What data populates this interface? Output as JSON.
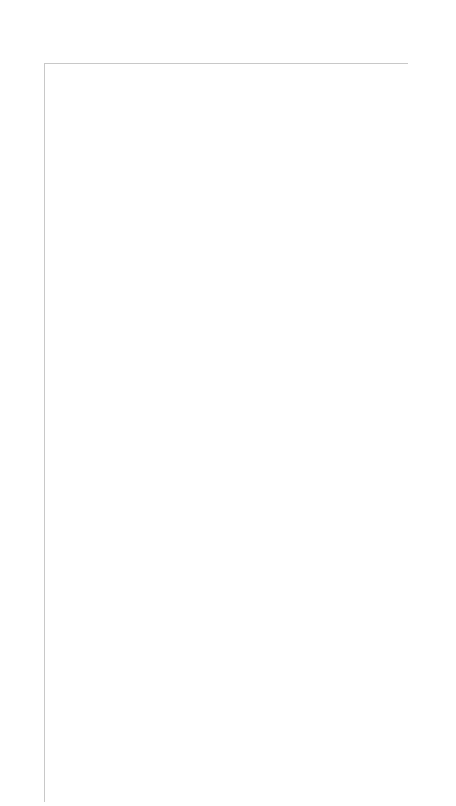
{
  "key_label": "Key",
  "grid": {
    "columns": 15,
    "rows": 30,
    "line_color": "#c8c8c8",
    "symbol_color": "#000000"
  },
  "symbols": {
    "dot": "purl (filled dot)",
    "B": "B",
    "O": "yarn over (circle)",
    "bs": "backslash decrease",
    "fs": "forward-slash decrease",
    "": "knit (blank)"
  },
  "left_row_labels": [
    30,
    28,
    26,
    24,
    22,
    20,
    18,
    16,
    14,
    12,
    10,
    8,
    6,
    4,
    2
  ],
  "right_row_labels": [
    29,
    27,
    25,
    23,
    21,
    19,
    17,
    15,
    13,
    11,
    9,
    7,
    5,
    3,
    1
  ],
  "chart_data": {
    "type": "table",
    "rows": [
      {
        "row": 30,
        "cells": [
          "dot",
          "dot",
          "dot",
          "dot",
          "dot",
          "dot",
          "dot",
          "dot",
          "dot",
          "dot",
          "dot",
          "dot",
          "dot",
          "dot",
          "dot"
        ]
      },
      {
        "row": 29,
        "cells": [
          "dot",
          "dot",
          "dot",
          "dot",
          "dot",
          "dot",
          "B",
          "",
          "B",
          "dot",
          "dot",
          "dot",
          "dot",
          "dot",
          "dot"
        ]
      },
      {
        "row": 28,
        "cells": [
          "dot",
          "dot",
          "dot",
          "dot",
          "dot",
          "dot",
          "",
          "dot",
          "",
          "dot",
          "dot",
          "dot",
          "dot",
          "dot",
          "dot"
        ]
      },
      {
        "row": 27,
        "cells": [
          "dot",
          "dot",
          "dot",
          "dot",
          "B",
          "",
          "dot",
          "",
          "dot",
          "",
          "B",
          "dot",
          "dot",
          "dot",
          "dot"
        ]
      },
      {
        "row": 26,
        "cells": [
          "dot",
          "dot",
          "dot",
          "dot",
          "",
          "dot",
          "",
          "dot",
          "",
          "dot",
          "",
          "dot",
          "dot",
          "dot",
          "dot"
        ]
      },
      {
        "row": 25,
        "cells": [
          "dot",
          "dot",
          "dot",
          "B",
          "dot",
          "",
          "dot",
          "",
          "dot",
          "",
          "dot",
          "B",
          "dot",
          "dot",
          "dot"
        ]
      },
      {
        "row": 24,
        "cells": [
          "dot",
          "dot",
          "dot",
          "dot",
          "",
          "dot",
          "",
          "dot",
          "",
          "dot",
          "",
          "dot",
          "dot",
          "dot",
          "dot"
        ]
      },
      {
        "row": 23,
        "cells": [
          "dot",
          "dot",
          "dot",
          "B",
          "dot",
          "",
          "dot",
          "",
          "dot",
          "",
          "dot",
          "B",
          "dot",
          "dot",
          "dot"
        ]
      },
      {
        "row": 22,
        "cells": [
          "",
          "dot",
          "dot",
          "dot",
          "",
          "dot",
          "",
          "dot",
          "",
          "dot",
          "",
          "dot",
          "dot",
          "dot",
          ""
        ]
      },
      {
        "row": 21,
        "cells": [
          "bs",
          "",
          "O",
          "dot",
          "B",
          "",
          "dot",
          "",
          "dot",
          "",
          "B",
          "dot",
          "O",
          "",
          "fs"
        ]
      },
      {
        "row": 20,
        "cells": [
          "",
          "",
          "",
          "dot",
          "dot",
          "dot",
          "",
          "dot",
          "",
          "dot",
          "dot",
          "dot",
          "",
          "",
          ""
        ]
      },
      {
        "row": 19,
        "cells": [
          "",
          "bs",
          "",
          "O",
          "dot",
          "dot",
          "B",
          "",
          "B",
          "dot",
          "dot",
          "O",
          "",
          "fs",
          ""
        ]
      },
      {
        "row": 18,
        "cells": [
          "",
          "",
          "",
          "",
          "dot",
          "dot",
          "dot",
          "",
          "dot",
          "dot",
          "dot",
          "",
          "",
          "",
          ""
        ]
      },
      {
        "row": 17,
        "cells": [
          "",
          "",
          "bs",
          "",
          "O",
          "dot",
          "dot",
          "",
          "dot",
          "dot",
          "O",
          "",
          "fs",
          "",
          ""
        ]
      },
      {
        "row": 16,
        "cells": [
          "",
          "",
          "",
          "",
          "",
          "dot",
          "dot",
          "",
          "dot",
          "dot",
          "",
          "",
          "",
          "",
          ""
        ]
      },
      {
        "row": 15,
        "cells": [
          "",
          "",
          "",
          "bs",
          "",
          "O",
          "dot",
          "",
          "dot",
          "O",
          "",
          "fs",
          "",
          "",
          ""
        ]
      },
      {
        "row": 14,
        "cells": [
          "",
          "",
          "",
          "",
          "",
          "",
          "dot",
          "",
          "dot",
          "",
          "",
          "",
          "",
          "",
          ""
        ]
      },
      {
        "row": 13,
        "cells": [
          "",
          "",
          "",
          "",
          "bs",
          "",
          "O",
          "",
          "O",
          "",
          "fs",
          "",
          "",
          "",
          ""
        ]
      },
      {
        "row": 12,
        "cells": [
          "",
          "",
          "",
          "",
          "",
          "",
          "",
          "dot",
          "",
          "",
          "",
          "",
          "",
          "",
          ""
        ]
      },
      {
        "row": 11,
        "cells": [
          "bs",
          "",
          "O",
          "",
          "",
          "",
          "",
          "dot",
          "",
          "",
          "",
          "",
          "O",
          "",
          "fs"
        ]
      },
      {
        "row": 10,
        "cells": [
          "dot",
          "",
          "",
          "",
          "",
          "",
          "",
          "dot",
          "",
          "",
          "",
          "",
          "",
          "",
          "dot"
        ]
      },
      {
        "row": 9,
        "cells": [
          "dot",
          "bs",
          "",
          "O",
          "",
          "",
          "",
          "dot",
          "",
          "",
          "",
          "O",
          "",
          "fs",
          "dot"
        ]
      },
      {
        "row": 8,
        "cells": [
          "dot",
          "dot",
          "",
          "",
          "",
          "",
          "",
          "dot",
          "",
          "",
          "",
          "",
          "",
          "dot",
          "dot"
        ]
      },
      {
        "row": 7,
        "cells": [
          "dot",
          "dot",
          "bs",
          "",
          "O",
          "",
          "",
          "dot",
          "",
          "",
          "O",
          "",
          "fs",
          "dot",
          "dot"
        ]
      },
      {
        "row": 6,
        "cells": [
          "dot",
          "dot",
          "dot",
          "",
          "",
          "",
          "",
          "dot",
          "",
          "",
          "",
          "",
          "dot",
          "dot",
          "dot"
        ]
      },
      {
        "row": 5,
        "cells": [
          "dot",
          "dot",
          "dot",
          "bs",
          "",
          "O",
          "",
          "dot",
          "",
          "O",
          "",
          "fs",
          "dot",
          "dot",
          "dot"
        ]
      },
      {
        "row": 4,
        "cells": [
          "dot",
          "dot",
          "dot",
          "dot",
          "",
          "",
          "",
          "dot",
          "",
          "",
          "",
          "dot",
          "dot",
          "dot",
          "dot"
        ]
      },
      {
        "row": 3,
        "cells": [
          "dot",
          "dot",
          "dot",
          "dot",
          "bs",
          "",
          "O",
          "dot",
          "O",
          "",
          "fs",
          "dot",
          "dot",
          "dot",
          "dot"
        ]
      },
      {
        "row": 2,
        "cells": [
          "dot",
          "dot",
          "dot",
          "dot",
          "dot",
          "",
          "",
          "dot",
          "",
          "",
          "dot",
          "dot",
          "dot",
          "dot",
          "dot"
        ]
      },
      {
        "row": 1,
        "cells": [
          "dot",
          "dot",
          "dot",
          "dot",
          "dot",
          "dot",
          "",
          "dot",
          "",
          "dot",
          "dot",
          "dot",
          "dot",
          "dot",
          "dot"
        ]
      }
    ]
  }
}
